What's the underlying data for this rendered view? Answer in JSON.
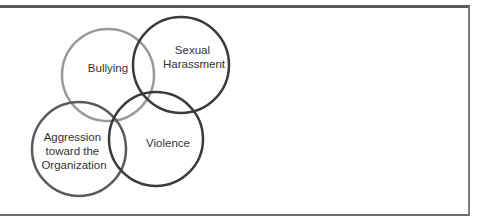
{
  "diagram": {
    "type": "venn",
    "circles": [
      {
        "id": "bullying",
        "label_lines": [
          "Bullying"
        ],
        "cx": 108,
        "cy": 75,
        "r": 46,
        "stroke": "#9a9a9a"
      },
      {
        "id": "sexual-harassment",
        "label_lines": [
          "Sexual",
          "Harassment"
        ],
        "cx": 181,
        "cy": 65,
        "r": 48,
        "stroke": "#3a3a3a"
      },
      {
        "id": "aggression",
        "label_lines": [
          "Aggression",
          "toward the",
          "Organization"
        ],
        "cx": 79,
        "cy": 149,
        "r": 47,
        "stroke": "#5a5a5a"
      },
      {
        "id": "violence",
        "label_lines": [
          "Violence"
        ],
        "cx": 156,
        "cy": 139,
        "r": 47,
        "stroke": "#3a3a3a"
      }
    ]
  }
}
